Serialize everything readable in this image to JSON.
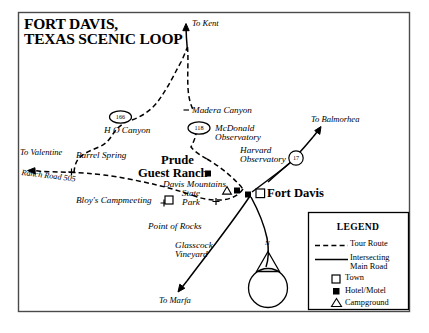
{
  "map": {
    "title_line1": "FORT DAVIS,",
    "title_line2": "TEXAS SCENIC LOOP",
    "destinations": [
      {
        "name": "To Kent",
        "label": "To Kent"
      },
      {
        "name": "To Valentine",
        "label": "To Valentine"
      },
      {
        "name": "To Balmorhea",
        "label": "To Balmorhea"
      },
      {
        "name": "To Marfa",
        "label": "To Marfa"
      }
    ],
    "places": [
      {
        "name": "Madera Canyon",
        "label": "Madera Canyon"
      },
      {
        "name": "H O Canyon",
        "label": "H O Canyon"
      },
      {
        "name": "Barrel Spring",
        "label": "Barrel Spring"
      },
      {
        "name": "Ranch Road 505",
        "label": "Ranch Road 505"
      },
      {
        "name": "McDonald Observatory",
        "label_line1": "McDonald",
        "label_line2": "Observatory"
      },
      {
        "name": "Harvard Observatory",
        "label_line1": "Harvard",
        "label_line2": "Observatory"
      },
      {
        "name": "Davis Mountains State Park",
        "label_line1": "Davis Mountains",
        "label_line2": "State",
        "label_line3": "Park"
      },
      {
        "name": "Bloy's Campmeeting",
        "label": "Bloy's Campmeeting"
      },
      {
        "name": "Point of Rocks",
        "label": "Point of Rocks"
      },
      {
        "name": "Glasscock Vineyard",
        "label_line1": "Glasscock",
        "label_line2": "Vineyard"
      }
    ],
    "major_places": [
      {
        "name": "Prude Guest Ranch",
        "label_line1": "Prude",
        "label_line2": "Guest Ranch"
      },
      {
        "name": "Fort Davis",
        "label": "Fort Davis"
      }
    ],
    "highway_shields": [
      {
        "name": "highway-166",
        "number": "166"
      },
      {
        "name": "highway-118",
        "number": "118"
      },
      {
        "name": "highway-17",
        "number": "17"
      }
    ],
    "compass": {
      "label": "N"
    },
    "legend": {
      "title": "LEGEND",
      "items": [
        {
          "symbol": "dashed-line",
          "label": "Tour Route"
        },
        {
          "symbol": "solid-line",
          "label_line1": "Intersecting",
          "label_line2": "Main Road"
        },
        {
          "symbol": "open-square",
          "label": "Town"
        },
        {
          "symbol": "filled-square",
          "label": "Hotel/Motel"
        },
        {
          "symbol": "triangle",
          "label": "Campground"
        }
      ]
    },
    "colors": {
      "ink": "#000000",
      "paper": "#ffffff",
      "frame": "#3a3a3a"
    }
  }
}
